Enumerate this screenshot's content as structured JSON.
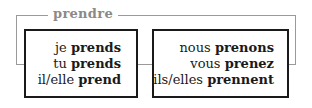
{
  "verb": "prendre",
  "colors": {
    "frame": "#9a9a9a",
    "title": "#8a8a8a",
    "box_border": "#1a1a1a",
    "text": "#1a1a1a"
  },
  "singular": [
    {
      "pronoun": "je",
      "form": "prends"
    },
    {
      "pronoun": "tu",
      "form": "prends"
    },
    {
      "pronoun": "il/elle",
      "form": "prend"
    }
  ],
  "plural": [
    {
      "pronoun": "nous",
      "form": "prenons"
    },
    {
      "pronoun": "vous",
      "form": "prenez"
    },
    {
      "pronoun": "ils/elles",
      "form": "prennent"
    }
  ]
}
